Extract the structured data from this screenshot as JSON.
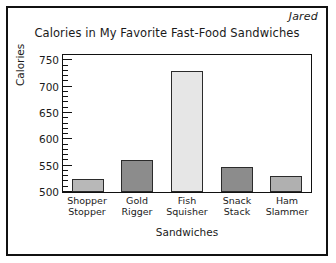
{
  "student_name": "Jared",
  "chart_data": {
    "type": "bar",
    "title": "Calories in My Favorite Fast-Food Sandwiches",
    "xlabel": "Sandwiches",
    "ylabel": "Calories",
    "categories": [
      "Shopper Stopper",
      "Gold Rigger",
      "Fish Squisher",
      "Snack Stack",
      "Ham Slammer"
    ],
    "category_lines": [
      [
        "Shopper",
        "Stopper"
      ],
      [
        "Gold",
        "Rigger"
      ],
      [
        "Fish",
        "Squisher"
      ],
      [
        "Snack",
        "Stack"
      ],
      [
        "Ham",
        "Slammer"
      ]
    ],
    "values": [
      525,
      560,
      730,
      548,
      530
    ],
    "bar_colors": [
      "#b8b8b8",
      "#8c8c8c",
      "#e6e6e6",
      "#8c8c8c",
      "#b0b0b0"
    ],
    "ylim": [
      500,
      760
    ],
    "ytick_labels": [
      "750",
      "700",
      "650",
      "600",
      "550",
      "500"
    ],
    "yticks": [
      750,
      700,
      650,
      600,
      550,
      500
    ],
    "ytick_minor_step": 10,
    "grid": false,
    "legend": "none"
  },
  "axis": {
    "line_color": "#111111"
  }
}
